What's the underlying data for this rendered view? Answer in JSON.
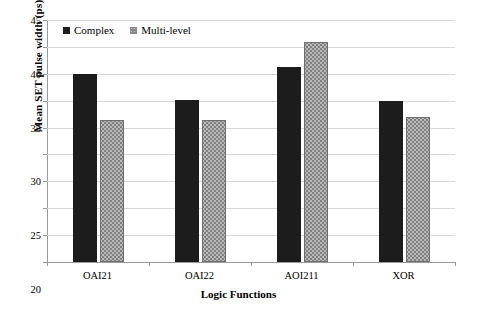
{
  "chart_data": {
    "type": "bar",
    "title": "",
    "xlabel": "Logic Functions",
    "ylabel": "Mean SET pulse width (ps)",
    "categories": [
      "OAI21",
      "OAI22",
      "AOI211",
      "XOR"
    ],
    "series": [
      {
        "name": "Complex",
        "values": [
          35.0,
          30.1,
          36.3,
          30.0
        ],
        "color": "#1c1c1c"
      },
      {
        "name": "Multi-level",
        "values": [
          26.4,
          26.4,
          41.0,
          27.0
        ],
        "color": "#808080"
      }
    ],
    "ylim": [
      0,
      45
    ],
    "yticks": [
      0,
      5,
      10,
      15,
      20,
      25,
      30,
      35,
      40,
      45
    ],
    "ytick_labels": [
      "0",
      "5",
      "10",
      "15",
      "20",
      "25",
      "30",
      "35",
      "40",
      "45"
    ],
    "grid": true,
    "legend_position": "top-left"
  }
}
